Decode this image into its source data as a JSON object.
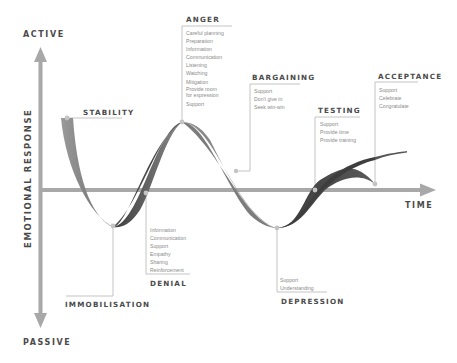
{
  "axes": {
    "y_top": "ACTIVE",
    "y_bottom": "PASSIVE",
    "y_title": "EMOTIONAL RESPONSE",
    "x_title": "TIME"
  },
  "stages": {
    "stability": {
      "label": "STABILITY",
      "items": []
    },
    "immobilisation": {
      "label": "IMMOBILISATION",
      "items": []
    },
    "denial": {
      "label": "DENIAL",
      "items": [
        "Information",
        "Communication",
        "Support",
        "Empathy",
        "Sharing",
        "Reinforcement"
      ]
    },
    "anger": {
      "label": "ANGER",
      "items": [
        "Careful planning",
        "Preparation",
        "Information",
        "Communication",
        "Listening",
        "Watching",
        "Mitigation",
        "Provide room",
        "for expression",
        "Support"
      ]
    },
    "bargaining": {
      "label": "BARGAINING",
      "items": [
        "Support",
        "Don't give in",
        "Seek win-win"
      ]
    },
    "depression": {
      "label": "DEPRESSION",
      "items": [
        "Support",
        "Understanding"
      ]
    },
    "testing": {
      "label": "TESTING",
      "items": [
        "Support",
        "Provide time",
        "Provide training"
      ]
    },
    "acceptance": {
      "label": "ACCEPTANCE",
      "items": [
        "Support",
        "Celebrate",
        "Congratulate"
      ]
    }
  },
  "colors": {
    "axis": "#a8a8a8",
    "ribbon_dark": "#3f3f3f",
    "ribbon_light": "#8c8c8c",
    "connector": "#b5b5b5",
    "text": "#4a4a4a",
    "subtext": "#8a8a8a"
  }
}
